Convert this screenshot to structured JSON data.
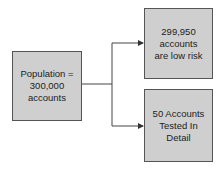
{
  "nodes": {
    "population": {
      "lines": [
        "Population =",
        "300,000",
        "accounts"
      ]
    },
    "low_risk": {
      "lines": [
        "299,950",
        "accounts",
        "are low risk"
      ]
    },
    "tested": {
      "lines": [
        "50 Accounts",
        "Tested In",
        "Detail"
      ]
    }
  },
  "colors": {
    "box_fill": "#cfcfcf",
    "box_border": "#555555",
    "line": "#444444"
  }
}
